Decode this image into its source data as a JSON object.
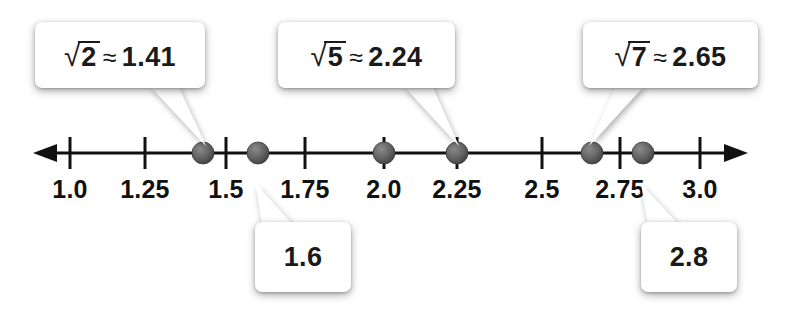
{
  "figure": {
    "axis_color": "#111111",
    "dot_color": "#5a5a5a",
    "bubble_color": "#ffffff"
  },
  "number_line": {
    "min": 1.0,
    "max": 3.0,
    "left_arrow": true,
    "right_arrow": true,
    "ticks": [
      {
        "value": 1.0,
        "label": "1.0",
        "x": 70
      },
      {
        "value": 1.25,
        "label": "1.25",
        "x": 145
      },
      {
        "value": 1.5,
        "label": "1.5",
        "x": 226
      },
      {
        "value": 1.75,
        "label": "1.75",
        "x": 305
      },
      {
        "value": 2.0,
        "label": "2.0",
        "x": 384
      },
      {
        "value": 2.25,
        "label": "2.25",
        "x": 457
      },
      {
        "value": 2.5,
        "label": "2.5",
        "x": 542
      },
      {
        "value": 2.75,
        "label": "2.75",
        "x": 620
      },
      {
        "value": 3.0,
        "label": "3.0",
        "x": 700
      }
    ],
    "points": [
      {
        "name": "sqrt2",
        "value": 1.41,
        "x": 203
      },
      {
        "name": "one-point-six",
        "value": 1.6,
        "x": 258
      },
      {
        "name": "two",
        "value": 2.0,
        "x": 384
      },
      {
        "name": "sqrt5",
        "value": 2.24,
        "x": 457
      },
      {
        "name": "sqrt7",
        "value": 2.65,
        "x": 592
      },
      {
        "name": "two-point-eight",
        "value": 2.8,
        "x": 643
      }
    ]
  },
  "callouts": [
    {
      "id": "sqrt2",
      "kind": "radical",
      "radicand": "2",
      "approx_symbol": "≈",
      "value": "1.41",
      "full_text": "√2 ≈ 1.41",
      "position": "above",
      "points_to_value": 1.41
    },
    {
      "id": "sqrt5",
      "kind": "radical",
      "radicand": "5",
      "approx_symbol": "≈",
      "value": "2.24",
      "full_text": "√5 ≈ 2.24",
      "position": "above",
      "points_to_value": 2.24
    },
    {
      "id": "sqrt7",
      "kind": "radical",
      "radicand": "7",
      "approx_symbol": "≈",
      "value": "2.65",
      "full_text": "√7 ≈ 2.65",
      "position": "above",
      "points_to_value": 2.65
    },
    {
      "id": "onesix",
      "kind": "decimal",
      "value": "1.6",
      "full_text": "1.6",
      "position": "below",
      "points_to_value": 1.6
    },
    {
      "id": "twoeight",
      "kind": "decimal",
      "value": "2.8",
      "full_text": "2.8",
      "position": "below",
      "points_to_value": 2.8
    }
  ],
  "chart_data": {
    "type": "scatter",
    "xlabel": "",
    "ylabel": "",
    "xlim": [
      1.0,
      3.0
    ],
    "grid": false,
    "legend": "none",
    "x_ticks": [
      1.0,
      1.25,
      1.5,
      1.75,
      2.0,
      2.25,
      2.5,
      2.75,
      3.0
    ],
    "x_tick_labels": [
      "1.0",
      "1.25",
      "1.5",
      "1.75",
      "2.0",
      "2.25",
      "2.5",
      "2.75",
      "3.0"
    ],
    "categories": [
      "√2",
      "1.6",
      "2.0",
      "√5",
      "√7",
      "2.8"
    ],
    "values": [
      1.41,
      1.6,
      2.0,
      2.24,
      2.65,
      2.8
    ],
    "annotations": [
      {
        "text": "√2 ≈ 1.41",
        "x": 1.41
      },
      {
        "text": "1.6",
        "x": 1.6
      },
      {
        "text": "√5 ≈ 2.24",
        "x": 2.24
      },
      {
        "text": "√7 ≈ 2.65",
        "x": 2.65
      },
      {
        "text": "2.8",
        "x": 2.8
      }
    ]
  }
}
